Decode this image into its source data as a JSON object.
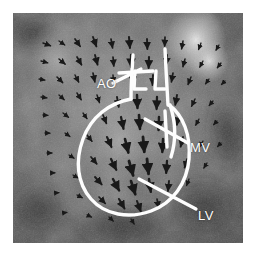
{
  "figure": {
    "modality": "phase-contrast velocity vector field",
    "view": "long-axis cardiac section",
    "frame_color": "#ffffff",
    "overlay_color": "#fdfdfd"
  },
  "annotations": [
    {
      "id": "ao",
      "label": "AO",
      "name": "aorta",
      "x": 84,
      "y": 64
    },
    {
      "id": "mv",
      "label": "MV",
      "name": "mitral-valve",
      "x": 177,
      "y": 128
    },
    {
      "id": "lv",
      "label": "LV",
      "name": "left-ventricle",
      "x": 185,
      "y": 196
    }
  ],
  "chart_data": {
    "type": "scatter",
    "title": "",
    "xlabel": "",
    "ylabel": "",
    "grid": false,
    "legend": "none",
    "image_extent": {
      "x": 13,
      "y": 13,
      "width": 230,
      "height": 230
    },
    "grayscale_stops": [
      {
        "name": "background-dark",
        "hex": "#343434"
      },
      {
        "name": "tissue-mid",
        "hex": "#6a6a6a"
      },
      {
        "name": "tissue-light",
        "hex": "#909090"
      },
      {
        "name": "bright-blob",
        "hex": "#e8e8e8"
      }
    ],
    "bright_regions": [
      {
        "name": "upper-right-bright-blob",
        "cx": 196,
        "cy": 40,
        "rx": 26,
        "ry": 30,
        "intensity": 0.95
      },
      {
        "name": "left-upper-bright",
        "cx": 58,
        "cy": 60,
        "rx": 30,
        "ry": 34,
        "intensity": 0.62
      },
      {
        "name": "mid-ventricle-bright",
        "cx": 120,
        "cy": 140,
        "rx": 36,
        "ry": 42,
        "intensity": 0.55
      }
    ],
    "contours": [
      {
        "name": "lv-endocardial-contour",
        "closed": false,
        "path": "M 118 86 C 96 90 78 104 70 126 C 62 148 64 170 78 186 C 92 202 116 206 138 198 C 160 190 174 170 176 146 C 178 122 170 102 156 92"
      },
      {
        "name": "aortic-root-left-wall",
        "closed": false,
        "path": "M 120 42 C 119 58 118 70 118 86"
      },
      {
        "name": "aortic-root-right-wall",
        "closed": false,
        "path": "M 152 36 C 153 58 154 74 155 92"
      },
      {
        "name": "aortic-valve-crossbar-left",
        "closed": false,
        "path": "M 106 60 L 140 58"
      },
      {
        "name": "aortic-valve-leaflet-left",
        "closed": false,
        "path": "M 122 58 L 121 76 L 133 76"
      },
      {
        "name": "aortic-valve-leaflet-right",
        "closed": false,
        "path": "M 143 58 L 142 76 L 152 76"
      },
      {
        "name": "mitral-valve-leaflet",
        "closed": false,
        "path": "M 157 92 C 163 110 163 128 158 144"
      },
      {
        "name": "mitral-annulus-bar",
        "closed": false,
        "path": "M 152 98 L 154 134"
      }
    ],
    "leader_lines": [
      {
        "name": "ao-leader",
        "from": [
          100,
          70
        ],
        "to": [
          128,
          56
        ]
      },
      {
        "name": "mv-leader",
        "from": [
          175,
          130
        ],
        "to": [
          132,
          106
        ]
      },
      {
        "name": "lv-leader",
        "from": [
          183,
          196
        ],
        "to": [
          126,
          166
        ]
      }
    ],
    "vector_field": {
      "arrow_color": "#1d1d1d",
      "note": "velocity vectors sampled on an irregular grid; length encodes speed, heading encodes flow direction",
      "vectors": [
        {
          "x": 30,
          "y": 30,
          "angle": 20,
          "len": 8
        },
        {
          "x": 46,
          "y": 28,
          "angle": 35,
          "len": 7
        },
        {
          "x": 62,
          "y": 26,
          "angle": 55,
          "len": 9
        },
        {
          "x": 80,
          "y": 24,
          "angle": 70,
          "len": 10
        },
        {
          "x": 98,
          "y": 26,
          "angle": 80,
          "len": 9
        },
        {
          "x": 116,
          "y": 24,
          "angle": 85,
          "len": 11
        },
        {
          "x": 134,
          "y": 26,
          "angle": 88,
          "len": 10
        },
        {
          "x": 152,
          "y": 24,
          "angle": 92,
          "len": 9
        },
        {
          "x": 170,
          "y": 28,
          "angle": 100,
          "len": 8
        },
        {
          "x": 188,
          "y": 30,
          "angle": 110,
          "len": 7
        },
        {
          "x": 206,
          "y": 32,
          "angle": 120,
          "len": 6
        },
        {
          "x": 28,
          "y": 48,
          "angle": 15,
          "len": 7
        },
        {
          "x": 46,
          "y": 46,
          "angle": 40,
          "len": 8
        },
        {
          "x": 64,
          "y": 44,
          "angle": 60,
          "len": 9
        },
        {
          "x": 82,
          "y": 42,
          "angle": 75,
          "len": 10
        },
        {
          "x": 100,
          "y": 44,
          "angle": 85,
          "len": 9
        },
        {
          "x": 118,
          "y": 42,
          "angle": 90,
          "len": 12
        },
        {
          "x": 136,
          "y": 44,
          "angle": 92,
          "len": 11
        },
        {
          "x": 154,
          "y": 42,
          "angle": 95,
          "len": 10
        },
        {
          "x": 172,
          "y": 46,
          "angle": 105,
          "len": 8
        },
        {
          "x": 190,
          "y": 48,
          "angle": 118,
          "len": 7
        },
        {
          "x": 208,
          "y": 50,
          "angle": 128,
          "len": 6
        },
        {
          "x": 26,
          "y": 66,
          "angle": 10,
          "len": 6
        },
        {
          "x": 44,
          "y": 64,
          "angle": 45,
          "len": 8
        },
        {
          "x": 62,
          "y": 62,
          "angle": 62,
          "len": 8
        },
        {
          "x": 80,
          "y": 60,
          "angle": 78,
          "len": 9
        },
        {
          "x": 100,
          "y": 62,
          "angle": 86,
          "len": 8
        },
        {
          "x": 120,
          "y": 60,
          "angle": 90,
          "len": 11
        },
        {
          "x": 140,
          "y": 62,
          "angle": 93,
          "len": 10
        },
        {
          "x": 160,
          "y": 60,
          "angle": 100,
          "len": 9
        },
        {
          "x": 178,
          "y": 64,
          "angle": 112,
          "len": 8
        },
        {
          "x": 196,
          "y": 66,
          "angle": 125,
          "len": 6
        },
        {
          "x": 212,
          "y": 68,
          "angle": 135,
          "len": 5
        },
        {
          "x": 28,
          "y": 84,
          "angle": 8,
          "len": 6
        },
        {
          "x": 46,
          "y": 82,
          "angle": 42,
          "len": 7
        },
        {
          "x": 64,
          "y": 80,
          "angle": 58,
          "len": 8
        },
        {
          "x": 84,
          "y": 82,
          "angle": 72,
          "len": 8
        },
        {
          "x": 104,
          "y": 84,
          "angle": 80,
          "len": 10
        },
        {
          "x": 124,
          "y": 82,
          "angle": 88,
          "len": 13
        },
        {
          "x": 144,
          "y": 84,
          "angle": 92,
          "len": 12
        },
        {
          "x": 164,
          "y": 82,
          "angle": 100,
          "len": 10
        },
        {
          "x": 182,
          "y": 86,
          "angle": 115,
          "len": 8
        },
        {
          "x": 200,
          "y": 88,
          "angle": 130,
          "len": 6
        },
        {
          "x": 30,
          "y": 102,
          "angle": 5,
          "len": 5
        },
        {
          "x": 50,
          "y": 100,
          "angle": 38,
          "len": 7
        },
        {
          "x": 70,
          "y": 100,
          "angle": 55,
          "len": 7
        },
        {
          "x": 90,
          "y": 102,
          "angle": 68,
          "len": 9
        },
        {
          "x": 108,
          "y": 104,
          "angle": 78,
          "len": 12
        },
        {
          "x": 126,
          "y": 102,
          "angle": 86,
          "len": 14
        },
        {
          "x": 146,
          "y": 104,
          "angle": 92,
          "len": 13
        },
        {
          "x": 166,
          "y": 102,
          "angle": 102,
          "len": 10
        },
        {
          "x": 186,
          "y": 106,
          "angle": 118,
          "len": 7
        },
        {
          "x": 204,
          "y": 108,
          "angle": 132,
          "len": 5
        },
        {
          "x": 32,
          "y": 120,
          "angle": 2,
          "len": 5
        },
        {
          "x": 52,
          "y": 120,
          "angle": 35,
          "len": 6
        },
        {
          "x": 74,
          "y": 122,
          "angle": 52,
          "len": 8
        },
        {
          "x": 94,
          "y": 124,
          "angle": 66,
          "len": 11
        },
        {
          "x": 112,
          "y": 126,
          "angle": 76,
          "len": 14
        },
        {
          "x": 130,
          "y": 124,
          "angle": 85,
          "len": 15
        },
        {
          "x": 150,
          "y": 126,
          "angle": 93,
          "len": 13
        },
        {
          "x": 170,
          "y": 124,
          "angle": 104,
          "len": 10
        },
        {
          "x": 190,
          "y": 128,
          "angle": 120,
          "len": 7
        },
        {
          "x": 208,
          "y": 130,
          "angle": 134,
          "len": 5
        },
        {
          "x": 34,
          "y": 140,
          "angle": 0,
          "len": 5
        },
        {
          "x": 56,
          "y": 142,
          "angle": 32,
          "len": 6
        },
        {
          "x": 78,
          "y": 144,
          "angle": 50,
          "len": 9
        },
        {
          "x": 98,
          "y": 146,
          "angle": 64,
          "len": 12
        },
        {
          "x": 116,
          "y": 148,
          "angle": 74,
          "len": 15
        },
        {
          "x": 134,
          "y": 146,
          "angle": 84,
          "len": 15
        },
        {
          "x": 154,
          "y": 148,
          "angle": 94,
          "len": 12
        },
        {
          "x": 174,
          "y": 146,
          "angle": 106,
          "len": 9
        },
        {
          "x": 194,
          "y": 150,
          "angle": 122,
          "len": 6
        },
        {
          "x": 38,
          "y": 160,
          "angle": 358,
          "len": 4
        },
        {
          "x": 60,
          "y": 162,
          "angle": 30,
          "len": 6
        },
        {
          "x": 82,
          "y": 164,
          "angle": 48,
          "len": 10
        },
        {
          "x": 100,
          "y": 166,
          "angle": 62,
          "len": 13
        },
        {
          "x": 118,
          "y": 168,
          "angle": 72,
          "len": 14
        },
        {
          "x": 136,
          "y": 166,
          "angle": 82,
          "len": 13
        },
        {
          "x": 156,
          "y": 168,
          "angle": 96,
          "len": 10
        },
        {
          "x": 176,
          "y": 166,
          "angle": 110,
          "len": 7
        },
        {
          "x": 42,
          "y": 180,
          "angle": 355,
          "len": 4
        },
        {
          "x": 64,
          "y": 182,
          "angle": 28,
          "len": 6
        },
        {
          "x": 86,
          "y": 184,
          "angle": 46,
          "len": 9
        },
        {
          "x": 106,
          "y": 186,
          "angle": 60,
          "len": 11
        },
        {
          "x": 124,
          "y": 188,
          "angle": 70,
          "len": 11
        },
        {
          "x": 144,
          "y": 186,
          "angle": 80,
          "len": 9
        },
        {
          "x": 50,
          "y": 200,
          "angle": 350,
          "len": 4
        },
        {
          "x": 74,
          "y": 202,
          "angle": 25,
          "len": 5
        },
        {
          "x": 96,
          "y": 204,
          "angle": 44,
          "len": 6
        },
        {
          "x": 118,
          "y": 206,
          "angle": 58,
          "len": 6
        }
      ]
    }
  }
}
